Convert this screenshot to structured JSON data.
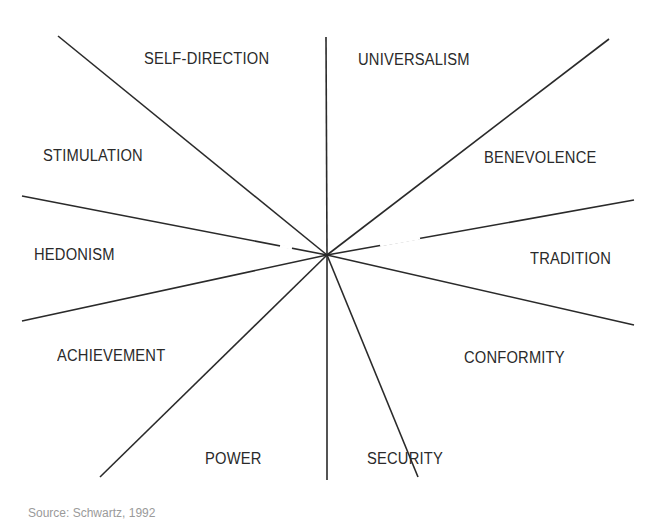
{
  "diagram": {
    "type": "circular value structure (radial lines)",
    "center": [
      327,
      255
    ],
    "line_color": "#2a2a2a",
    "lines": [
      {
        "from": [
          327,
          255
        ],
        "to": [
          326,
          37
        ]
      },
      {
        "from": [
          327,
          255
        ],
        "to": [
          327,
          480
        ]
      },
      {
        "from": [
          327,
          255
        ],
        "to": [
          58,
          36
        ]
      },
      {
        "from": [
          327,
          255
        ],
        "to": [
          609,
          39
        ]
      },
      {
        "from": [
          327,
          255
        ],
        "to": [
          22,
          196
        ]
      },
      {
        "from": [
          327,
          255
        ],
        "to": [
          634,
          200
        ]
      },
      {
        "from": [
          327,
          255
        ],
        "to": [
          22,
          321
        ]
      },
      {
        "from": [
          327,
          255
        ],
        "to": [
          634,
          325
        ]
      },
      {
        "from": [
          327,
          255
        ],
        "to": [
          100,
          477
        ]
      },
      {
        "from": [
          327,
          255
        ],
        "to": [
          418,
          477
        ]
      }
    ],
    "labels": {
      "self_direction": "SELF-DIRECTION",
      "universalism": "UNIVERSALISM",
      "stimulation": "STIMULATION",
      "benevolence": "BENEVOLENCE",
      "hedonism": "HEDONISM",
      "tradition": "TRADITION",
      "achievement": "ACHIEVEMENT",
      "conformity": "CONFORMITY",
      "power": "POWER",
      "security": "SECURITY"
    }
  },
  "footer": {
    "source": "Source: Schwartz, 1992"
  }
}
